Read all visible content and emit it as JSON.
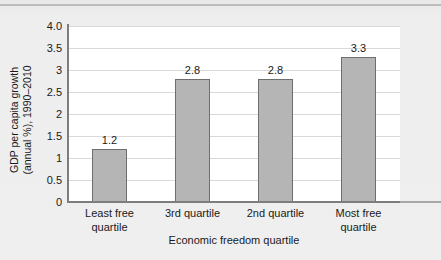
{
  "chart_data": {
    "type": "bar",
    "title": "",
    "xlabel": "Economic freedom quartile",
    "ylabel": "GDP per capita growth (annual %), 1990–2010",
    "ylabel_line1": "GDP per capita growth",
    "ylabel_line2": "(annual %), 1990–2010",
    "categories": [
      "Least free quartile",
      "3rd quartile",
      "2nd quartile",
      "Most free quartile"
    ],
    "category_lines": [
      [
        "Least free",
        "quartile"
      ],
      [
        "3rd quartile",
        ""
      ],
      [
        "2nd quartile",
        ""
      ],
      [
        "Most free",
        "quartile"
      ]
    ],
    "values": [
      1.2,
      2.8,
      2.8,
      3.3
    ],
    "value_labels": [
      "1.2",
      "2.8",
      "2.8",
      "3.3"
    ],
    "ylim": [
      0,
      4.0
    ],
    "ytick_values": [
      4.0,
      3.5,
      3,
      2.5,
      2,
      1.5,
      1,
      0.5,
      0
    ],
    "ytick_labels": [
      "4.0",
      "3.5",
      "3",
      "2.5",
      "2",
      "1.5",
      "1",
      "0.5",
      "0"
    ],
    "grid": true,
    "grid_axis": "y",
    "legend": false,
    "legend_position": "none",
    "colors": {
      "bar_fill": "#b5b5b5",
      "bar_border": "#6e6e6e",
      "gridline": "#d9d9d9",
      "axis": "#7d7d7d",
      "panel_background": "#ffffff",
      "page_background": "#ededed",
      "text": "#1a1a1a"
    }
  }
}
